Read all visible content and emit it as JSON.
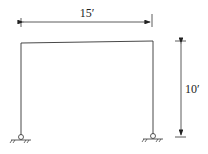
{
  "diagram": {
    "type": "portal-frame",
    "span_label": "15′",
    "height_label": "10′",
    "supports": [
      "roller",
      "roller"
    ],
    "line_color": "#333333"
  }
}
